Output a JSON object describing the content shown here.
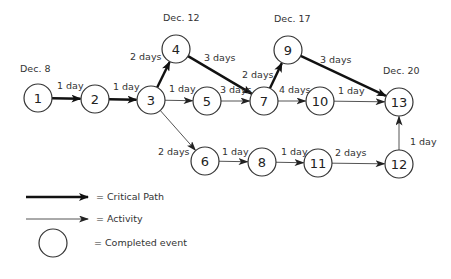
{
  "diagram": {
    "type": "PERT network diagram",
    "dates": [
      {
        "label": "Dec. 8",
        "x": 20,
        "y": 72
      },
      {
        "label": "Dec. 12",
        "x": 163,
        "y": 21
      },
      {
        "label": "Dec. 17",
        "x": 274,
        "y": 22
      },
      {
        "label": "Dec. 20",
        "x": 383,
        "y": 74
      }
    ],
    "nodes": [
      {
        "id": "1",
        "label": "1",
        "x": 38,
        "y": 98
      },
      {
        "id": "2",
        "label": "2",
        "x": 95,
        "y": 99
      },
      {
        "id": "3",
        "label": "3",
        "x": 151,
        "y": 100
      },
      {
        "id": "4",
        "label": "4",
        "x": 176,
        "y": 49
      },
      {
        "id": "5",
        "label": "5",
        "x": 207,
        "y": 101
      },
      {
        "id": "6",
        "label": "6",
        "x": 205,
        "y": 161
      },
      {
        "id": "7",
        "label": "7",
        "x": 264,
        "y": 101
      },
      {
        "id": "8",
        "label": "8",
        "x": 262,
        "y": 162
      },
      {
        "id": "9",
        "label": "9",
        "x": 288,
        "y": 50
      },
      {
        "id": "10",
        "label": "10",
        "x": 320,
        "y": 101
      },
      {
        "id": "11",
        "label": "11",
        "x": 318,
        "y": 163
      },
      {
        "id": "12",
        "label": "12",
        "x": 399,
        "y": 164
      },
      {
        "id": "13",
        "label": "13",
        "x": 399,
        "y": 102
      }
    ],
    "edges": [
      {
        "from": "1",
        "to": "2",
        "duration": "1 day",
        "critical": true,
        "lx": 57,
        "ly": 89
      },
      {
        "from": "2",
        "to": "3",
        "duration": "1 day",
        "critical": true,
        "lx": 113,
        "ly": 90
      },
      {
        "from": "3",
        "to": "4",
        "duration": "2 days",
        "critical": true,
        "lx": 130,
        "ly": 60
      },
      {
        "from": "4",
        "to": "7",
        "duration": "3 days",
        "critical": true,
        "lx": 204,
        "ly": 61
      },
      {
        "from": "3",
        "to": "5",
        "duration": "1 day",
        "critical": false,
        "lx": 169,
        "ly": 92
      },
      {
        "from": "5",
        "to": "7",
        "duration": "3 days",
        "critical": false,
        "lx": 220,
        "ly": 93
      },
      {
        "from": "3",
        "to": "6",
        "duration": "2 days",
        "critical": false,
        "lx": 158,
        "ly": 155
      },
      {
        "from": "7",
        "to": "9",
        "duration": "2 days",
        "critical": true,
        "lx": 242,
        "ly": 78
      },
      {
        "from": "7",
        "to": "10",
        "duration": "4 days",
        "critical": false,
        "lx": 279,
        "ly": 93
      },
      {
        "from": "9",
        "to": "13",
        "duration": "3 days",
        "critical": true,
        "lx": 320,
        "ly": 63
      },
      {
        "from": "10",
        "to": "13",
        "duration": "1 day",
        "critical": false,
        "lx": 338,
        "ly": 94
      },
      {
        "from": "6",
        "to": "8",
        "duration": "1 day",
        "critical": false,
        "lx": 222,
        "ly": 155
      },
      {
        "from": "8",
        "to": "11",
        "duration": "1 day",
        "critical": false,
        "lx": 281,
        "ly": 155
      },
      {
        "from": "11",
        "to": "12",
        "duration": "2 days",
        "critical": false,
        "lx": 335,
        "ly": 156
      },
      {
        "from": "12",
        "to": "13",
        "duration": "1 day",
        "critical": false,
        "lx": 410,
        "ly": 145
      }
    ]
  },
  "legend": {
    "critical_path": "= Critical Path",
    "activity": "= Activity",
    "completed_event": "= Completed event"
  },
  "colors": {
    "critical": "#111111",
    "activity": "#555555",
    "node_stroke": "#333333"
  }
}
